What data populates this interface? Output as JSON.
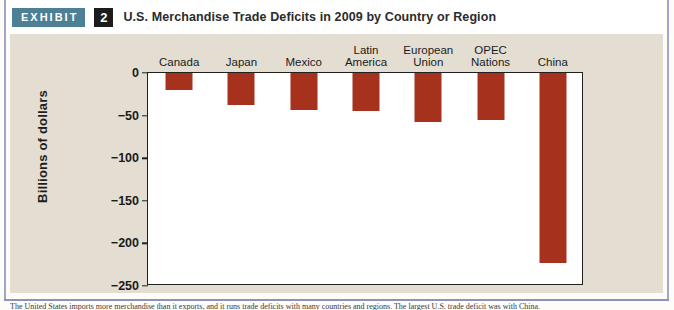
{
  "header": {
    "exhibit_label": "EXHIBIT",
    "exhibit_number": "2",
    "title": "U.S. Merchandise Trade Deficits in 2009 by Country or Region"
  },
  "colors": {
    "bar": "#a6311d",
    "exhibit_badge": "#4d7f95",
    "number_badge": "#1c1c1c",
    "panel_background": "#e4ded2",
    "plot_background": "#ffffff",
    "frame": "#20201e",
    "page_rule": "#a3a5cb"
  },
  "caption": {
    "text": "The United States imports more merchandise than it exports, and it runs trade deficits with many countries and regions. The largest U.S. trade deficit was with China."
  },
  "chart_data": {
    "type": "bar",
    "title": "U.S. Merchandise Trade Deficits in 2009 by Country or Region",
    "xlabel": "",
    "ylabel": "Billions of dollars",
    "categories": [
      "Canada",
      "Japan",
      "Mexico",
      "Latin\nAmerica",
      "European\nUnion",
      "OPEC\nNations",
      "China"
    ],
    "values": [
      -20,
      -38,
      -44,
      -45,
      -58,
      -55,
      -223
    ],
    "ylim": [
      -250,
      0
    ],
    "yticks": [
      0,
      -50,
      -100,
      -150,
      -200,
      -250
    ],
    "ytick_labels": [
      "0",
      "−50",
      "−100",
      "−150",
      "−200",
      "−250"
    ],
    "grid": false,
    "legend": false
  }
}
